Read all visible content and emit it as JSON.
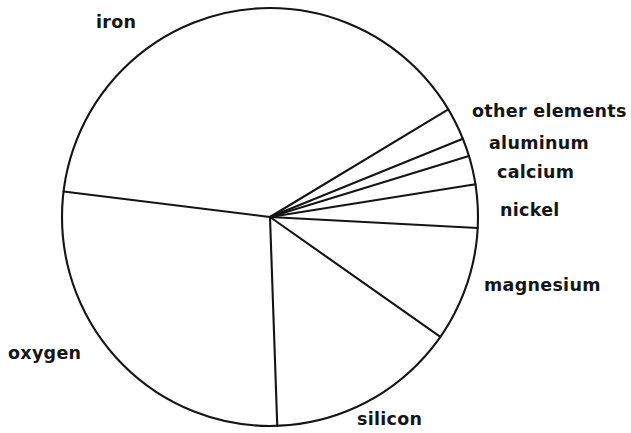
{
  "chart_data": {
    "type": "pie",
    "title": "",
    "subtitle": "",
    "xlabel": "",
    "ylabel": "",
    "legend_position": "none",
    "grid": false,
    "note": "Hand-drawn style pie chart of elemental composition; slice sizes estimated from wedge angles, unlabeled numerically in the figure.",
    "categories": [
      "iron",
      "other elements",
      "aluminum",
      "calcium",
      "nickel",
      "magnesium",
      "silicon",
      "oxygen"
    ],
    "values": [
      61.7,
      2.5,
      1.4,
      2.2,
      3.3,
      8.9,
      14.7,
      5.3
    ],
    "slices": [
      {
        "label": "iron",
        "value": 61.7,
        "start_angle_deg": 187.0,
        "end_angle_deg": 329.0,
        "sweep_deg": 142.0,
        "label_x": 96,
        "label_y": 14
      },
      {
        "label": "other elements",
        "value": 2.5,
        "start_angle_deg": 329.0,
        "end_angle_deg": 338.0,
        "sweep_deg": 9.0,
        "label_x": 472,
        "label_y": 103
      },
      {
        "label": "aluminum",
        "value": 1.4,
        "start_angle_deg": 338.0,
        "end_angle_deg": 343.0,
        "sweep_deg": 5.0,
        "label_x": 489,
        "label_y": 135
      },
      {
        "label": "calcium",
        "value": 2.2,
        "start_angle_deg": 343.0,
        "end_angle_deg": 351.0,
        "sweep_deg": 8.0,
        "label_x": 497,
        "label_y": 164
      },
      {
        "label": "nickel",
        "value": 3.3,
        "start_angle_deg": 351.0,
        "end_angle_deg": 363.0,
        "sweep_deg": 12.0,
        "label_x": 500,
        "label_y": 202
      },
      {
        "label": "magnesium",
        "value": 8.9,
        "start_angle_deg": 363.0,
        "end_angle_deg": 395.0,
        "sweep_deg": 32.0,
        "label_x": 484,
        "label_y": 277
      },
      {
        "label": "silicon",
        "value": 14.7,
        "start_angle_deg": 395.0,
        "end_angle_deg": 448.0,
        "sweep_deg": 53.0,
        "label_x": 357,
        "label_y": 411
      },
      {
        "label": "oxygen",
        "value": 5.3,
        "start_angle_deg": 448.0,
        "end_angle_deg": 547.0,
        "sweep_deg": 99.0,
        "label_x": 8,
        "label_y": 345
      }
    ],
    "geometry": {
      "center_x": 270,
      "center_y": 217,
      "radius_x": 208,
      "radius_y": 209
    },
    "colors": {
      "stroke": "#141414",
      "fill": "#ffffff",
      "text": "#151515",
      "background": "#ffffff"
    }
  },
  "labels": {
    "iron": "iron",
    "other_elements": "other elements",
    "aluminum": "aluminum",
    "calcium": "calcium",
    "nickel": "nickel",
    "magnesium": "magnesium",
    "silicon": "silicon",
    "oxygen": "oxygen"
  }
}
